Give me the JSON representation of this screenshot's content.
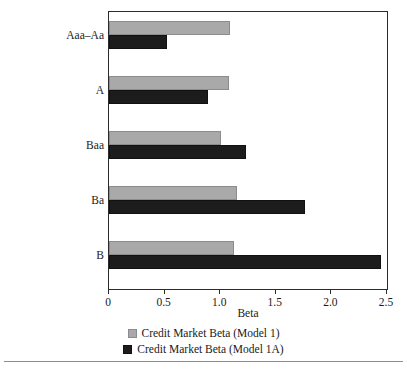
{
  "chart_data": {
    "type": "bar",
    "orientation": "horizontal",
    "title": "",
    "xlabel": "Beta",
    "ylabel": "",
    "categories": [
      "Aaa–Aa",
      "A",
      "Baa",
      "Ba",
      "B"
    ],
    "series": [
      {
        "name": "Credit Market Beta (Model 1)",
        "color": "#a9a9a9",
        "values": [
          1.09,
          1.08,
          1.01,
          1.15,
          1.12
        ]
      },
      {
        "name": "Credit Market Beta (Model 1A)",
        "color": "#1c1c1c",
        "values": [
          0.52,
          0.89,
          1.23,
          1.76,
          2.45
        ]
      }
    ],
    "xlim": [
      0,
      2.5
    ],
    "xticks": [
      0,
      0.5,
      1.0,
      1.5,
      2.0,
      2.5
    ],
    "xtick_labels": [
      "0",
      "0.5",
      "1.0",
      "1.5",
      "2.0",
      "2.5"
    ],
    "grid": false,
    "legend_position": "bottom"
  },
  "legend": {
    "entries": [
      {
        "label": "Credit Market Beta (Model 1)"
      },
      {
        "label": "Credit Market Beta (Model 1A)"
      }
    ]
  }
}
